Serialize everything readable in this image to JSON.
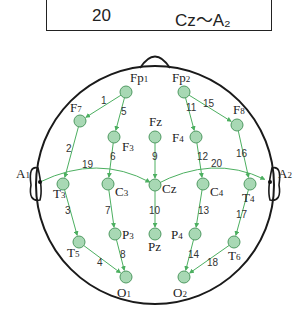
{
  "table_row": {
    "number": "20",
    "derivation": "Cz～A₂"
  },
  "colors": {
    "electrode_fill": "#a8d8b4",
    "electrode_stroke": "#4f9a62",
    "arrow": "#4caf60",
    "outline": "#1a1a1a"
  },
  "electrodes": [
    {
      "id": "Fp1",
      "base": "Fp",
      "sub": "1",
      "x": 126,
      "y": 92
    },
    {
      "id": "Fp2",
      "base": "Fp",
      "sub": "2",
      "x": 184,
      "y": 92
    },
    {
      "id": "F7",
      "base": "F",
      "sub": "7",
      "x": 80,
      "y": 121
    },
    {
      "id": "F3",
      "base": "F",
      "sub": "3",
      "x": 114,
      "y": 137
    },
    {
      "id": "Fz",
      "base": "Fz",
      "sub": "",
      "x": 155,
      "y": 137
    },
    {
      "id": "F4",
      "base": "F",
      "sub": "4",
      "x": 196,
      "y": 137
    },
    {
      "id": "F8",
      "base": "F",
      "sub": "8",
      "x": 237,
      "y": 125
    },
    {
      "id": "T3",
      "base": "T",
      "sub": "3",
      "x": 63,
      "y": 184
    },
    {
      "id": "C3",
      "base": "C",
      "sub": "3",
      "x": 108,
      "y": 184
    },
    {
      "id": "Cz",
      "base": "Cz",
      "sub": "",
      "x": 155,
      "y": 185
    },
    {
      "id": "C4",
      "base": "C",
      "sub": "4",
      "x": 203,
      "y": 184
    },
    {
      "id": "T4",
      "base": "T",
      "sub": "4",
      "x": 250,
      "y": 184
    },
    {
      "id": "T5",
      "base": "T",
      "sub": "5",
      "x": 79,
      "y": 242
    },
    {
      "id": "P3",
      "base": "P",
      "sub": "3",
      "x": 115,
      "y": 234
    },
    {
      "id": "Pz",
      "base": "Pz",
      "sub": "",
      "x": 155,
      "y": 234
    },
    {
      "id": "P4",
      "base": "P",
      "sub": "4",
      "x": 195,
      "y": 234
    },
    {
      "id": "T6",
      "base": "T",
      "sub": "6",
      "x": 234,
      "y": 242
    },
    {
      "id": "O1",
      "base": "O",
      "sub": "1",
      "x": 126,
      "y": 277
    },
    {
      "id": "O2",
      "base": "O",
      "sub": "2",
      "x": 184,
      "y": 277
    }
  ],
  "ears": [
    {
      "id": "A1",
      "base": "A",
      "sub": "1",
      "x": 38,
      "y": 182
    },
    {
      "id": "A2",
      "base": "A",
      "sub": "2",
      "x": 273,
      "y": 182
    }
  ],
  "montage_links": [
    {
      "n": "1",
      "from": "Fp1",
      "to": "F7"
    },
    {
      "n": "2",
      "from": "F7",
      "to": "T3"
    },
    {
      "n": "3",
      "from": "T3",
      "to": "T5"
    },
    {
      "n": "4",
      "from": "T5",
      "to": "O1"
    },
    {
      "n": "5",
      "from": "Fp1",
      "to": "F3"
    },
    {
      "n": "6",
      "from": "F3",
      "to": "C3"
    },
    {
      "n": "7",
      "from": "C3",
      "to": "P3"
    },
    {
      "n": "8",
      "from": "P3",
      "to": "O1"
    },
    {
      "n": "9",
      "from": "Fz",
      "to": "Cz"
    },
    {
      "n": "10",
      "from": "Cz",
      "to": "Pz"
    },
    {
      "n": "11",
      "from": "Fp2",
      "to": "F4"
    },
    {
      "n": "12",
      "from": "F4",
      "to": "C4"
    },
    {
      "n": "13",
      "from": "C4",
      "to": "P4"
    },
    {
      "n": "14",
      "from": "P4",
      "to": "O2"
    },
    {
      "n": "15",
      "from": "Fp2",
      "to": "F8"
    },
    {
      "n": "16",
      "from": "F8",
      "to": "T4"
    },
    {
      "n": "17",
      "from": "T4",
      "to": "T6"
    },
    {
      "n": "18",
      "from": "T6",
      "to": "O2"
    },
    {
      "n": "19",
      "from": "A1",
      "to": "Cz"
    },
    {
      "n": "20",
      "from": "Cz",
      "to": "A2"
    }
  ]
}
